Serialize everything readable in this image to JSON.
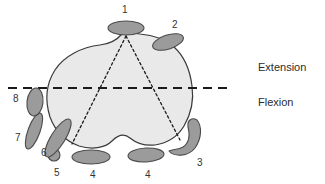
{
  "figure": {
    "background_color": "#ffffff",
    "body_fill": "#e9e9e9",
    "body_stroke": "#3a3a3a",
    "structure_fill": "#9b9b9b",
    "structure_stroke": "#4a4a4a",
    "dashed_line_color": "#1a1a1a",
    "dotted_line_color": "#1a1a1a"
  },
  "side_labels": [
    {
      "id": "extension",
      "text": "Extension",
      "x": 258,
      "y": 62
    },
    {
      "id": "flexion",
      "text": "Flexion",
      "x": 258,
      "y": 97
    }
  ],
  "numbered_labels": [
    {
      "id": "label-1",
      "text": "1",
      "x": 122,
      "y": 5
    },
    {
      "id": "label-2",
      "text": "2",
      "x": 172,
      "y": 20
    },
    {
      "id": "label-3",
      "text": "3",
      "x": 197,
      "y": 158
    },
    {
      "id": "label-4-left",
      "text": "4",
      "x": 90,
      "y": 170
    },
    {
      "id": "label-4-right",
      "text": "4",
      "x": 145,
      "y": 170
    },
    {
      "id": "label-5",
      "text": "5",
      "x": 54,
      "y": 168
    },
    {
      "id": "label-6",
      "text": "6",
      "x": 41,
      "y": 148
    },
    {
      "id": "label-7",
      "text": "7",
      "x": 15,
      "y": 133
    },
    {
      "id": "label-8",
      "text": "8",
      "x": 13,
      "y": 94
    }
  ],
  "structures": [
    {
      "id": "structure-1",
      "shape": "ellipse",
      "cx": 126,
      "cy": 28,
      "rx": 18,
      "ry": 7,
      "rotation": 0
    },
    {
      "id": "structure-2",
      "shape": "ellipse",
      "cx": 168,
      "cy": 42,
      "rx": 16,
      "ry": 7,
      "rotation": -18
    },
    {
      "id": "structure-3",
      "shape": "crescent",
      "cx": 186,
      "cy": 142
    },
    {
      "id": "structure-4-left",
      "shape": "ellipse",
      "cx": 91,
      "cy": 157,
      "rx": 19,
      "ry": 7,
      "rotation": 0
    },
    {
      "id": "structure-4-right",
      "shape": "ellipse",
      "cx": 146,
      "cy": 155,
      "rx": 18,
      "ry": 7,
      "rotation": -3
    },
    {
      "id": "structure-5",
      "shape": "ellipse",
      "cx": 54,
      "cy": 155,
      "rx": 6,
      "ry": 6,
      "rotation": 0
    },
    {
      "id": "structure-6",
      "shape": "ellipse",
      "cx": 58,
      "cy": 138,
      "rx": 7,
      "ry": 22,
      "rotation": 32
    },
    {
      "id": "structure-7",
      "shape": "ellipse",
      "cx": 34,
      "cy": 131,
      "rx": 6,
      "ry": 19,
      "rotation": 20
    },
    {
      "id": "structure-8",
      "shape": "ellipse",
      "cx": 35,
      "cy": 102,
      "rx": 8,
      "ry": 14,
      "rotation": 6
    }
  ],
  "body_outline": {
    "id": "femoral-condyle-body",
    "path": "M 122 34 C 116 41 109 44 100 45 C 82 47 64 56 55 70 C 46 84 45 101 50 117 C 55 131 66 141 79 146 C 92 150 105 148 112 141 C 118 135 124 133 130 138 C 136 143 145 146 155 145 C 168 143 178 136 184 126 C 191 114 194 100 192 86 C 190 70 184 56 174 47 C 165 39 152 35 140 34 C 134 33 127 32 122 34 Z"
  },
  "reference_line": {
    "id": "extension-flexion-line",
    "x1": 8,
    "y1": 88,
    "x2": 230,
    "y2": 88,
    "style": "dashed"
  },
  "radiating_lines": [
    {
      "id": "dotted-line-left",
      "x1": 126,
      "y1": 36,
      "x2": 72,
      "y2": 144
    },
    {
      "id": "dotted-line-right",
      "x1": 126,
      "y1": 36,
      "x2": 180,
      "y2": 140
    }
  ]
}
